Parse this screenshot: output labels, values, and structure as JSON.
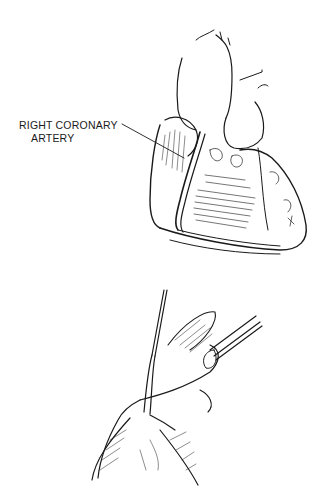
{
  "figure": {
    "type": "medical line illustration",
    "top_panel": {
      "subject": "heart, anterior view",
      "label": {
        "line1": "RIGHT CORONARY",
        "line2": "ARTERY"
      }
    },
    "bottom_panel": {
      "subject": "vessel dissection with surgical instruments"
    },
    "colors": {
      "ink": "#1a1a1a",
      "background": "#ffffff"
    }
  }
}
